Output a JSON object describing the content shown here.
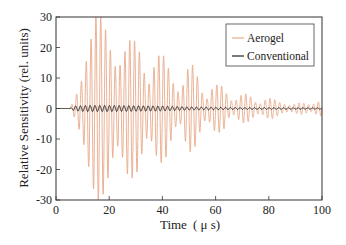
{
  "chart_data": {
    "type": "line",
    "title": "",
    "xlabel": "Time (μs)",
    "ylabel": "Relative Sensitivity (rel. units)",
    "xlim": [
      0,
      100
    ],
    "ylim": [
      -30,
      30
    ],
    "xticks": [
      0,
      20,
      40,
      60,
      80,
      100
    ],
    "yticks": [
      -30,
      -20,
      -10,
      0,
      10,
      20,
      30
    ],
    "grid": false,
    "legend_position": "upper right",
    "series": [
      {
        "name": "Aerogel",
        "color": "#e8a98a",
        "description": "Damped oscillating waveform, ~0.55 MHz, onset ~5 μs, peak ±30 near 15–18 μs, secondary packets decaying to ~±2 by 100 μs",
        "envelope_points": [
          [
            0,
            0
          ],
          [
            5,
            0
          ],
          [
            7,
            3
          ],
          [
            10,
            10
          ],
          [
            13,
            22
          ],
          [
            15,
            30
          ],
          [
            17,
            30
          ],
          [
            19,
            25
          ],
          [
            21,
            17
          ],
          [
            23,
            12
          ],
          [
            25,
            16
          ],
          [
            27,
            22
          ],
          [
            29,
            23
          ],
          [
            31,
            20
          ],
          [
            33,
            12
          ],
          [
            35,
            8
          ],
          [
            37,
            14
          ],
          [
            39,
            18
          ],
          [
            41,
            17
          ],
          [
            43,
            11
          ],
          [
            45,
            6
          ],
          [
            47,
            5
          ],
          [
            49,
            12
          ],
          [
            51,
            15
          ],
          [
            53,
            11
          ],
          [
            55,
            5
          ],
          [
            57,
            3
          ],
          [
            59,
            7
          ],
          [
            61,
            8
          ],
          [
            63,
            7
          ],
          [
            65,
            3
          ],
          [
            67,
            2
          ],
          [
            69,
            4
          ],
          [
            71,
            5
          ],
          [
            73,
            4
          ],
          [
            75,
            2
          ],
          [
            77,
            1.5
          ],
          [
            79,
            3
          ],
          [
            81,
            3.5
          ],
          [
            83,
            2.5
          ],
          [
            85,
            1.5
          ],
          [
            88,
            1
          ],
          [
            90,
            1.5
          ],
          [
            92,
            2
          ],
          [
            94,
            1.5
          ],
          [
            96,
            1
          ],
          [
            98,
            2
          ],
          [
            100,
            2.5
          ]
        ],
        "frequency_mhz": 0.55
      },
      {
        "name": "Conventional",
        "color": "#222222",
        "description": "Small oscillation about zero, amplitude ~±1, onset ~5 μs",
        "envelope_points": [
          [
            0,
            0
          ],
          [
            5,
            0
          ],
          [
            7,
            0.8
          ],
          [
            12,
            1.0
          ],
          [
            20,
            1.0
          ],
          [
            30,
            0.9
          ],
          [
            40,
            0.8
          ],
          [
            50,
            0.5
          ],
          [
            60,
            0.4
          ],
          [
            70,
            0.3
          ],
          [
            80,
            0.3
          ],
          [
            90,
            0.2
          ],
          [
            100,
            0.2
          ]
        ],
        "frequency_mhz": 0.55
      }
    ]
  },
  "legend": {
    "items": [
      {
        "label": "Aerogel",
        "color": "#e8a98a"
      },
      {
        "label": "Conventional",
        "color": "#222222"
      }
    ]
  },
  "axes": {
    "xlabel_main": "Time",
    "xlabel_unit": "( μ s)",
    "ylabel": "Relative Sensitivity (rel. units)"
  }
}
